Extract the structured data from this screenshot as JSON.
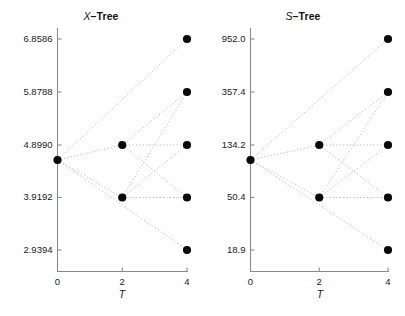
{
  "figure": {
    "width": 405,
    "height": 316,
    "background": "#ffffff",
    "node_color": "#0a0a0a",
    "edge_color": "#b9b9b9",
    "axis_color": "#8a8a8a"
  },
  "panels": [
    {
      "id": "x-tree",
      "title_var": "X",
      "title_suffix": "–Tree",
      "xlabel": "T",
      "ylabel": "",
      "xticks": [
        "0",
        "2",
        "4"
      ],
      "xtick_values": [
        0,
        2,
        4
      ],
      "yticks": [
        "6.8586",
        "5.8788",
        "4.8990",
        "3.9192",
        "2.9394"
      ],
      "ytick_values": [
        6.8586,
        5.8788,
        4.899,
        3.9192,
        2.9394
      ],
      "scale": "linear"
    },
    {
      "id": "s-tree",
      "title_var": "S",
      "title_suffix": "–Tree",
      "xlabel": "T",
      "ylabel": "",
      "xticks": [
        "0",
        "2",
        "4"
      ],
      "xtick_values": [
        0,
        2,
        4
      ],
      "yticks": [
        "952.0",
        "357.4",
        "134.2",
        "50.4",
        "18.9"
      ],
      "ytick_values": [
        952.0,
        357.4,
        134.2,
        50.4,
        18.9
      ],
      "scale": "log"
    }
  ],
  "chart_data": {
    "type": "scatter",
    "subtitle": "",
    "layout": "two side-by-side panels, recombining binomial trees, dotted connector edges, filled black circular nodes",
    "grid": false,
    "legend": null,
    "panels": [
      {
        "name": "X-Tree",
        "xlabel": "T",
        "ylabel": "",
        "xlim": [
          0,
          4
        ],
        "ylim": [
          2.4496,
          7.3484
        ],
        "xticks": [
          0,
          2,
          4
        ],
        "yticks": [
          6.8586,
          5.8788,
          4.899,
          3.9192,
          2.9394
        ],
        "scale": "linear",
        "nodes": [
          {
            "t": 0,
            "value": 4.6541,
            "level": 0
          },
          {
            "t": 2,
            "value": 4.899,
            "level": 1
          },
          {
            "t": 2,
            "value": 3.9192,
            "level": -1
          },
          {
            "t": 4,
            "value": 6.8586,
            "level": 2
          },
          {
            "t": 4,
            "value": 5.8788,
            "level": 1
          },
          {
            "t": 4,
            "value": 4.899,
            "level": 0
          },
          {
            "t": 4,
            "value": 3.9192,
            "level": -1
          },
          {
            "t": 4,
            "value": 2.9394,
            "level": -2
          }
        ],
        "edges": [
          {
            "from": [
              0,
              4.6541
            ],
            "to": [
              2,
              4.899
            ]
          },
          {
            "from": [
              0,
              4.6541
            ],
            "to": [
              2,
              3.9192
            ]
          },
          {
            "from": [
              0,
              4.6541
            ],
            "to": [
              4,
              6.8586
            ]
          },
          {
            "from": [
              0,
              4.6541
            ],
            "to": [
              4,
              2.9394
            ]
          },
          {
            "from": [
              2,
              4.899
            ],
            "to": [
              4,
              5.8788
            ]
          },
          {
            "from": [
              2,
              4.899
            ],
            "to": [
              4,
              3.9192
            ]
          },
          {
            "from": [
              2,
              4.899
            ],
            "to": [
              4,
              4.899
            ]
          },
          {
            "from": [
              2,
              3.9192
            ],
            "to": [
              4,
              4.899
            ]
          },
          {
            "from": [
              2,
              3.9192
            ],
            "to": [
              4,
              3.9192
            ]
          },
          {
            "from": [
              2,
              3.9192
            ],
            "to": [
              4,
              5.8788
            ]
          }
        ]
      },
      {
        "name": "S-Tree",
        "xlabel": "T",
        "ylabel": "",
        "xlim": [
          0,
          4
        ],
        "ylim": [
          11.6,
          1740.0
        ],
        "xticks": [
          0,
          2,
          4
        ],
        "yticks": [
          952.0,
          357.4,
          134.2,
          50.4,
          18.9
        ],
        "scale": "log",
        "nodes": [
          {
            "t": 0,
            "value": 105.1,
            "level": 0
          },
          {
            "t": 2,
            "value": 134.2,
            "level": 1
          },
          {
            "t": 2,
            "value": 50.4,
            "level": -1
          },
          {
            "t": 4,
            "value": 952.0,
            "level": 2
          },
          {
            "t": 4,
            "value": 357.4,
            "level": 1
          },
          {
            "t": 4,
            "value": 134.2,
            "level": 0
          },
          {
            "t": 4,
            "value": 50.4,
            "level": -1
          },
          {
            "t": 4,
            "value": 18.9,
            "level": -2
          }
        ],
        "edges": [
          {
            "from": [
              0,
              105.1
            ],
            "to": [
              2,
              134.2
            ]
          },
          {
            "from": [
              0,
              105.1
            ],
            "to": [
              2,
              50.4
            ]
          },
          {
            "from": [
              0,
              105.1
            ],
            "to": [
              4,
              952.0
            ]
          },
          {
            "from": [
              0,
              105.1
            ],
            "to": [
              4,
              18.9
            ]
          },
          {
            "from": [
              2,
              134.2
            ],
            "to": [
              4,
              357.4
            ]
          },
          {
            "from": [
              2,
              134.2
            ],
            "to": [
              4,
              50.4
            ]
          },
          {
            "from": [
              2,
              134.2
            ],
            "to": [
              4,
              134.2
            ]
          },
          {
            "from": [
              2,
              50.4
            ],
            "to": [
              4,
              134.2
            ]
          },
          {
            "from": [
              2,
              50.4
            ],
            "to": [
              4,
              50.4
            ]
          },
          {
            "from": [
              2,
              50.4
            ],
            "to": [
              4,
              357.4
            ]
          }
        ]
      }
    ]
  }
}
